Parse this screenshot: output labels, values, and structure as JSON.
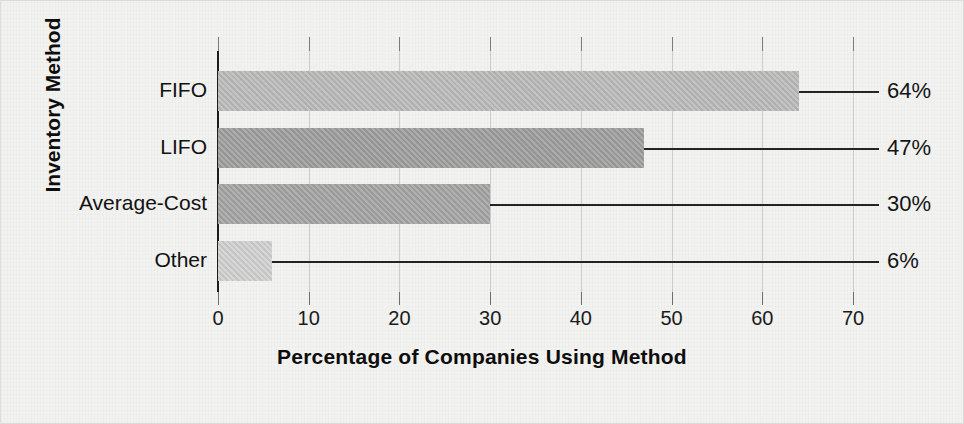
{
  "chart_data": {
    "type": "bar",
    "orientation": "horizontal",
    "title": "",
    "xlabel": "Percentage of Companies Using Method",
    "ylabel": "Inventory Method",
    "categories": [
      "FIFO",
      "LIFO",
      "Average-Cost",
      "Other"
    ],
    "values": [
      64,
      47,
      30,
      6
    ],
    "value_labels": [
      "64%",
      "47%",
      "30%",
      "6%"
    ],
    "xlim": [
      0,
      70
    ],
    "xticks": [
      0,
      10,
      20,
      30,
      40,
      50,
      60,
      70
    ],
    "xtick_labels": [
      "0",
      "10",
      "20",
      "30",
      "40",
      "50",
      "60",
      "70"
    ],
    "grid": true,
    "legend": "none",
    "bar_colors": [
      "#b9b9b9",
      "#9d9d9d",
      "#a3a3a3",
      "#cfcfcf"
    ],
    "background_color": "#f2f2f0",
    "axis_color": "#1d1d1d"
  },
  "figure": {
    "ylabel": "Inventory Method",
    "xlabel": "Percentage of Companies Using Method"
  }
}
